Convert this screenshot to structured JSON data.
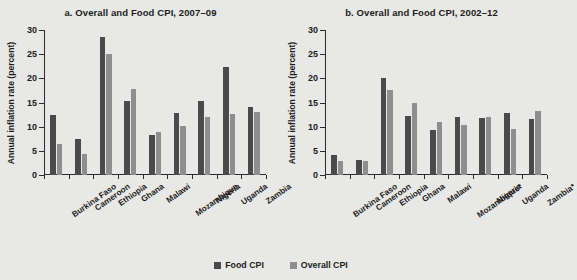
{
  "figure": {
    "ylabel": "Annual inflation rate (percent)",
    "yticks": [
      0,
      5,
      10,
      15,
      20,
      25,
      30
    ],
    "legend": [
      {
        "label": "Food  CPI",
        "color": "#4a4a4a",
        "key": "food"
      },
      {
        "label": "Overall CPI",
        "color": "#8e8e8e",
        "key": "overall"
      }
    ]
  },
  "chart_data": [
    {
      "type": "bar",
      "panel": "a",
      "title": "a. Overall and Food CPI, 2007–09",
      "xlabel": "",
      "ylabel": "Annual inflation rate (percent)",
      "ylim": [
        0,
        30
      ],
      "yticks": [
        0,
        5,
        10,
        15,
        20,
        25,
        30
      ],
      "grid": false,
      "legend_position": "bottom-center",
      "categories": [
        "Burkina Faso",
        "Cameroon",
        "Ethiopia",
        "Ghana",
        "Malawi",
        "Mozambique",
        "Nigeria",
        "Uganda",
        "Zambia"
      ],
      "series": [
        {
          "name": "Food  CPI",
          "color": "#4a4a4a",
          "values": [
            12.4,
            7.5,
            28.5,
            15.3,
            8.2,
            12.8,
            15.3,
            22.4,
            14.0
          ]
        },
        {
          "name": "Overall CPI",
          "color": "#8e8e8e",
          "values": [
            6.5,
            4.3,
            25.0,
            17.8,
            9.0,
            10.2,
            12.0,
            12.7,
            13.0
          ]
        }
      ]
    },
    {
      "type": "bar",
      "panel": "b",
      "title": "b. Overall and Food CPI, 2002–12",
      "xlabel": "",
      "ylabel": "Annual inflation rate (percent)",
      "ylim": [
        0,
        30
      ],
      "yticks": [
        0,
        5,
        10,
        15,
        20,
        25,
        30
      ],
      "grid": false,
      "legend_position": "bottom-center",
      "categories": [
        "Burkina Faso",
        "Cameroon",
        "Ethiopia",
        "Ghana",
        "Malawi",
        "Mozambique*",
        "Nigeria",
        "Uganda",
        "Zambia*"
      ],
      "series": [
        {
          "name": "Food  CPI",
          "color": "#4a4a4a",
          "values": [
            4.2,
            3.2,
            20.0,
            12.2,
            9.3,
            12.1,
            11.7,
            12.9,
            11.6
          ]
        },
        {
          "name": "Overall CPI",
          "color": "#8e8e8e",
          "values": [
            3.0,
            2.9,
            17.6,
            14.8,
            11.0,
            10.4,
            12.0,
            9.5,
            13.2
          ]
        }
      ]
    }
  ]
}
